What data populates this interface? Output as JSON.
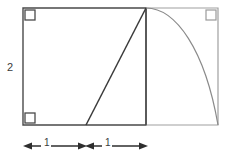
{
  "figure": {
    "colors": {
      "primary_stroke": "#4a4a4a",
      "secondary_stroke": "#9a9a9a",
      "label_text": "#3a3a3a",
      "background": "#ffffff"
    },
    "labels": {
      "height": "2",
      "segment_left": "1",
      "segment_right": "1"
    },
    "icons": {
      "right_angle_top_left": "right-angle-marker",
      "right_angle_bottom_left": "right-angle-marker",
      "right_angle_top_right": "right-angle-marker",
      "dimension_arrow_left": "arrow-left",
      "dimension_arrow_right": "arrow-right",
      "dimension_arrow_mid_left": "arrow-right",
      "dimension_arrow_mid_right": "arrow-left"
    },
    "geometry": {
      "rectangle": {
        "x": 23,
        "y": 8,
        "width": 195,
        "height": 117
      },
      "divider_x": 146,
      "triangle_apex": {
        "x": 146,
        "y": 8
      },
      "triangle_base_vertex": {
        "x": 86,
        "y": 125
      },
      "arc_start": {
        "x": 146,
        "y": 8
      },
      "arc_end": {
        "x": 218,
        "y": 125
      },
      "dimension_line_y": 146,
      "dimension_start_x": 24,
      "dimension_mid_x": 86,
      "dimension_end_x": 146
    }
  }
}
